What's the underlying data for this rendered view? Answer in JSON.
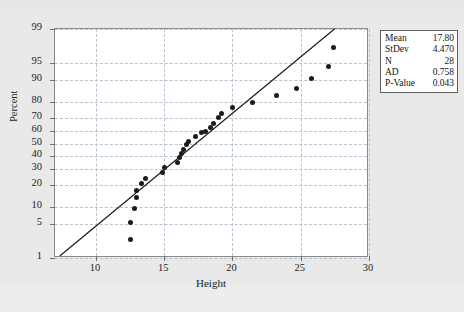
{
  "chart_data": {
    "type": "scatter",
    "title": "",
    "xlabel": "Height",
    "ylabel": "Percent",
    "xlim": [
      7,
      30
    ],
    "ylim": [
      1,
      99
    ],
    "yscale": "normal-probability",
    "grid": true,
    "xticks": [
      10,
      15,
      20,
      25,
      30
    ],
    "yticks": [
      1,
      5,
      10,
      20,
      30,
      40,
      50,
      60,
      70,
      80,
      90,
      95,
      99
    ],
    "series": [
      {
        "name": "Height",
        "marker": "filled-circle",
        "color": "#1b1b1b",
        "points": [
          {
            "x": 12.5,
            "y": 2.6
          },
          {
            "x": 12.5,
            "y": 5.5
          },
          {
            "x": 12.8,
            "y": 9.5
          },
          {
            "x": 13.0,
            "y": 13.5
          },
          {
            "x": 13.0,
            "y": 17.0
          },
          {
            "x": 13.3,
            "y": 21.0
          },
          {
            "x": 13.6,
            "y": 24.0
          },
          {
            "x": 14.9,
            "y": 28.0
          },
          {
            "x": 15.0,
            "y": 31.5
          },
          {
            "x": 16.0,
            "y": 35.0
          },
          {
            "x": 16.1,
            "y": 38.5
          },
          {
            "x": 16.3,
            "y": 42.0
          },
          {
            "x": 16.4,
            "y": 45.5
          },
          {
            "x": 16.6,
            "y": 49.0
          },
          {
            "x": 16.8,
            "y": 52.0
          },
          {
            "x": 17.3,
            "y": 55.5
          },
          {
            "x": 17.7,
            "y": 59.0
          },
          {
            "x": 18.0,
            "y": 59.5
          },
          {
            "x": 18.4,
            "y": 63.0
          },
          {
            "x": 18.6,
            "y": 66.0
          },
          {
            "x": 19.0,
            "y": 70.0
          },
          {
            "x": 19.2,
            "y": 73.0
          },
          {
            "x": 20.0,
            "y": 77.0
          },
          {
            "x": 21.5,
            "y": 80.0
          },
          {
            "x": 23.2,
            "y": 83.5
          },
          {
            "x": 24.7,
            "y": 87.0
          },
          {
            "x": 25.8,
            "y": 90.5
          },
          {
            "x": 27.0,
            "y": 94.0
          },
          {
            "x": 27.4,
            "y": 97.5
          }
        ]
      }
    ],
    "fit_line": {
      "name": "normal-reference-line",
      "color": "#1b1b1b",
      "x1": 7.35,
      "y1": 1.0,
      "x2": 27.6,
      "y2": 99.0
    }
  },
  "stats_box": {
    "rows": [
      {
        "key": "Mean",
        "value": "17.80"
      },
      {
        "key": "StDev",
        "value": "4.470"
      },
      {
        "key": "N",
        "value": "28"
      },
      {
        "key": "AD",
        "value": "0.758"
      },
      {
        "key": "P-Value",
        "value": "0.043"
      }
    ]
  },
  "axis": {
    "x_title": "Height",
    "y_title": "Percent",
    "x_tick_labels": [
      "10",
      "15",
      "20",
      "25",
      "30"
    ],
    "y_tick_labels": [
      "99",
      "95",
      "90",
      "80",
      "70",
      "60",
      "50",
      "40",
      "30",
      "20",
      "10",
      "5",
      "1"
    ]
  },
  "colors": {
    "page_background": "#e9e9e9",
    "plot_background": "#ffffff",
    "grid": "#b9c2cf",
    "frame": "#8a8a8a",
    "marker": "#1b1b1b",
    "text": "#1d1d1d"
  }
}
